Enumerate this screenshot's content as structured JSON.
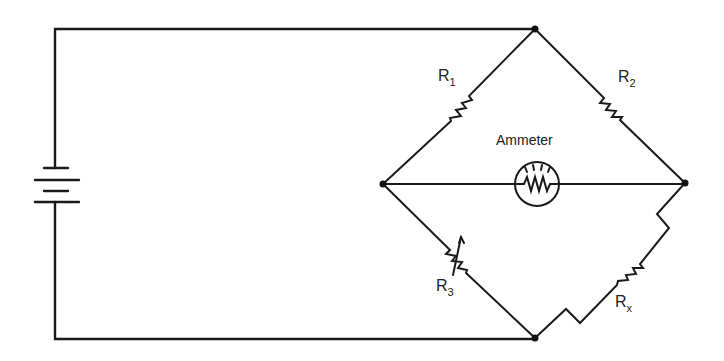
{
  "diagram": {
    "type": "Wheatstone bridge circuit",
    "components": {
      "battery": {
        "label": ""
      },
      "r1": {
        "label": "R",
        "subscript": "1"
      },
      "r2": {
        "label": "R",
        "subscript": "2"
      },
      "r3": {
        "label": "R",
        "subscript": "3",
        "variable": true
      },
      "rx": {
        "label": "R",
        "subscript": "x"
      },
      "ammeter": {
        "label": "Ammeter"
      }
    },
    "nodes": [
      "top",
      "left",
      "right",
      "bottom"
    ],
    "colors": {
      "line": "#1a1a1a",
      "background": "#ffffff"
    }
  }
}
